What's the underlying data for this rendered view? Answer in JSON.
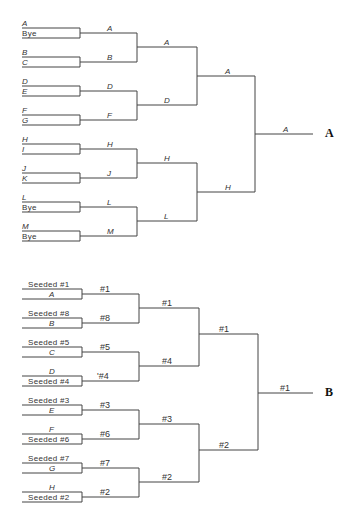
{
  "bracket_a": {
    "label": "A",
    "round1": [
      {
        "top": "A",
        "bottom": "Bye"
      },
      {
        "top": "B",
        "bottom": "C"
      },
      {
        "top": "D",
        "bottom": "E"
      },
      {
        "top": "F",
        "bottom": "G"
      },
      {
        "top": "H",
        "bottom": "I"
      },
      {
        "top": "J",
        "bottom": "K"
      },
      {
        "top": "L",
        "bottom": "Bye"
      },
      {
        "top": "M",
        "bottom": "Bye"
      }
    ],
    "round2": [
      "A",
      "B",
      "D",
      "F",
      "H",
      "J",
      "L",
      "M"
    ],
    "round3": [
      "A",
      "D",
      "H",
      "L"
    ],
    "round4": [
      "A",
      "H"
    ],
    "winner": "A"
  },
  "bracket_b": {
    "label": "B",
    "round1": [
      {
        "top": "Seeded #1",
        "bottom": "A"
      },
      {
        "top": "Seeded #8",
        "bottom": "B"
      },
      {
        "top": "Seeded #5",
        "bottom": "C"
      },
      {
        "top": "D",
        "bottom": "Seeded #4"
      },
      {
        "top": "Seeded #3",
        "bottom": "E"
      },
      {
        "top": "F",
        "bottom": "Seeded #6"
      },
      {
        "top": "Seeded #7",
        "bottom": "G"
      },
      {
        "top": "H",
        "bottom": "Seeded #2"
      }
    ],
    "round2": [
      "#1",
      "#8",
      "#5",
      "'#4",
      "#3",
      "#6",
      "#7",
      "#2"
    ],
    "round3": [
      "#1",
      "#4",
      "#3",
      "#2"
    ],
    "round4": [
      "#1",
      "#2"
    ],
    "winner": "#1"
  }
}
